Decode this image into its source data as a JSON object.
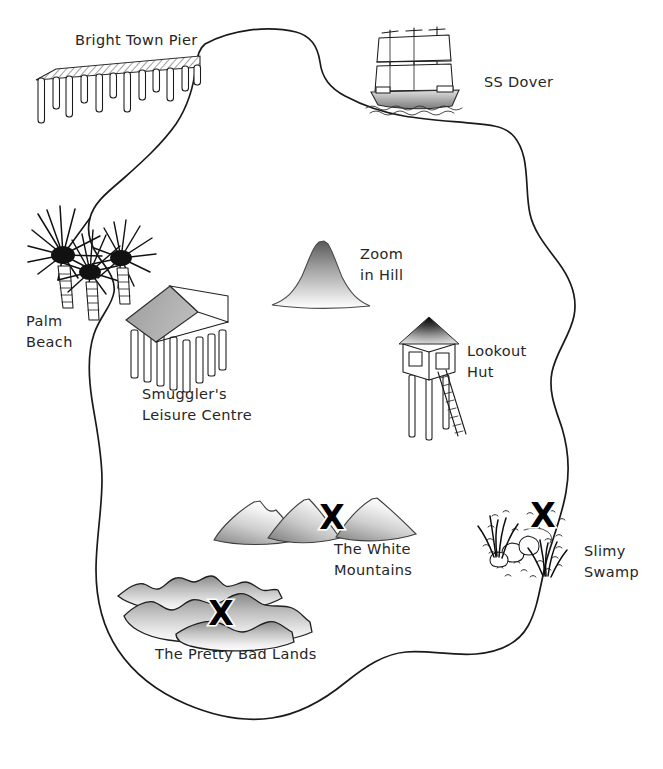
{
  "map": {
    "title_partial": "",
    "width": 663,
    "height": 769,
    "background_color": "#ffffff",
    "ink_color": "#1a1a1a",
    "label_color": "#262626",
    "x_mark_color": "#000000"
  },
  "labels": {
    "pier": "Bright Town Pier",
    "ship": "SS Dover",
    "beach_line1": "Palm",
    "beach_line2": "Beach",
    "leisure_line1": "Smuggler's",
    "leisure_line2": "Leisure Centre",
    "hill_line1": "Zoom",
    "hill_line2": "in Hill",
    "hut_line1": "Lookout",
    "hut_line2": "Hut",
    "mountains_line1": "The White",
    "mountains_line2": "Mountains",
    "swamp_line1": "Slimy",
    "swamp_line2": "Swamp",
    "badlands": "The Pretty Bad Lands"
  },
  "x_marks": [
    {
      "id": "x-white-mountains",
      "glyph": "X",
      "x": 332,
      "y": 529
    },
    {
      "id": "x-slimy-swamp",
      "glyph": "X",
      "x": 543,
      "y": 527
    },
    {
      "id": "x-pretty-bad-lands",
      "glyph": "X",
      "x": 221,
      "y": 625
    }
  ],
  "features": [
    {
      "id": "bright-town-pier",
      "name": "Bright Town Pier",
      "kind": "pier"
    },
    {
      "id": "ss-dover",
      "name": "SS Dover",
      "kind": "ship"
    },
    {
      "id": "palm-beach",
      "name": "Palm Beach",
      "kind": "beach"
    },
    {
      "id": "smugglers-leisure-centre",
      "name": "Smuggler's Leisure Centre",
      "kind": "building"
    },
    {
      "id": "zoom-in-hill",
      "name": "Zoom in Hill",
      "kind": "hill"
    },
    {
      "id": "lookout-hut",
      "name": "Lookout Hut",
      "kind": "building"
    },
    {
      "id": "the-white-mountains",
      "name": "The White Mountains",
      "kind": "mountains"
    },
    {
      "id": "slimy-swamp",
      "name": "Slimy Swamp",
      "kind": "swamp"
    },
    {
      "id": "the-pretty-bad-lands",
      "name": "The Pretty Bad Lands",
      "kind": "badlands"
    }
  ]
}
